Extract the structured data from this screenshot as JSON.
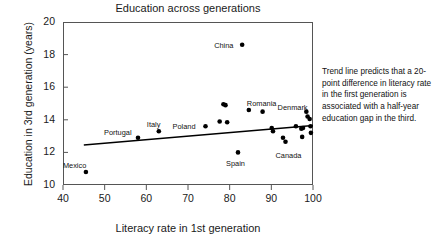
{
  "chart_data": {
    "type": "scatter",
    "title": "Education across generations",
    "xlabel": "Literacy rate in 1st generation",
    "ylabel": "Education in 3rd generation (years)",
    "xlim": [
      40,
      100
    ],
    "ylim": [
      10,
      20
    ],
    "xticks": [
      40,
      50,
      60,
      70,
      80,
      90,
      100
    ],
    "yticks": [
      10,
      12,
      14,
      16,
      18,
      20
    ],
    "grid": false,
    "legend": null,
    "points": [
      {
        "x": 45.5,
        "y": 10.8,
        "label": "Mexico"
      },
      {
        "x": 58.0,
        "y": 12.9,
        "label": "Portugal"
      },
      {
        "x": 63.0,
        "y": 13.3,
        "label": "Italy"
      },
      {
        "x": 74.2,
        "y": 13.6,
        "label": "Poland"
      },
      {
        "x": 77.6,
        "y": 13.9,
        "label": ""
      },
      {
        "x": 78.5,
        "y": 14.95,
        "label": ""
      },
      {
        "x": 79.0,
        "y": 14.9,
        "label": ""
      },
      {
        "x": 79.4,
        "y": 13.85,
        "label": ""
      },
      {
        "x": 82.0,
        "y": 12.0,
        "label": "Spain"
      },
      {
        "x": 83.0,
        "y": 18.6,
        "label": "China"
      },
      {
        "x": 84.6,
        "y": 14.6,
        "label": "Romania"
      },
      {
        "x": 87.9,
        "y": 14.5,
        "label": ""
      },
      {
        "x": 90.1,
        "y": 13.5,
        "label": ""
      },
      {
        "x": 90.4,
        "y": 13.3,
        "label": ""
      },
      {
        "x": 92.8,
        "y": 12.9,
        "label": ""
      },
      {
        "x": 93.4,
        "y": 12.65,
        "label": "Canada"
      },
      {
        "x": 95.9,
        "y": 13.6,
        "label": ""
      },
      {
        "x": 97.2,
        "y": 13.45,
        "label": ""
      },
      {
        "x": 97.4,
        "y": 12.95,
        "label": ""
      },
      {
        "x": 97.6,
        "y": 13.5,
        "label": ""
      },
      {
        "x": 98.4,
        "y": 14.5,
        "label": ""
      },
      {
        "x": 98.7,
        "y": 14.2,
        "label": "Denmark"
      },
      {
        "x": 99.2,
        "y": 14.05,
        "label": ""
      },
      {
        "x": 99.4,
        "y": 13.6,
        "label": ""
      },
      {
        "x": 99.5,
        "y": 13.2,
        "label": ""
      }
    ],
    "trend_line": {
      "x_start": 45.0,
      "y_start": 12.45,
      "x_end": 100.0,
      "y_end": 13.65
    },
    "annotation": "Trend line predicts that a 20-point difference in literacy rate in the first generation is associated with a half-year education gap in the third."
  }
}
